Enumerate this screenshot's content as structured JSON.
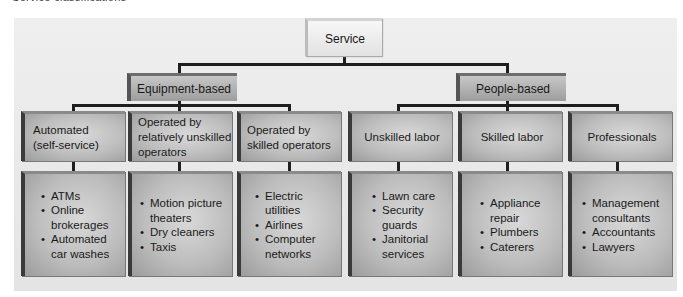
{
  "caption": "Service classifications",
  "root": {
    "label": "Service"
  },
  "categories": [
    {
      "label": "Equipment-based",
      "children": [
        {
          "label_lines": [
            "Automated",
            "(self-service)"
          ],
          "examples": [
            "ATMs",
            "Online brokerages",
            "Automated car washes"
          ]
        },
        {
          "label_lines": [
            "Operated by",
            "relatively unskilled",
            "operators"
          ],
          "examples": [
            "Motion picture theaters",
            "Dry cleaners",
            "Taxis"
          ]
        },
        {
          "label_lines": [
            "Operated by",
            "skilled operators"
          ],
          "examples": [
            "Electric utilities",
            "Airlines",
            "Computer networks"
          ]
        }
      ]
    },
    {
      "label": "People-based",
      "children": [
        {
          "label_lines": [
            "Unskilled labor"
          ],
          "examples": [
            "Lawn care",
            "Security guards",
            "Janitorial services"
          ]
        },
        {
          "label_lines": [
            "Skilled labor"
          ],
          "examples": [
            "Appliance repair",
            "Plumbers",
            "Caterers"
          ]
        },
        {
          "label_lines": [
            "Professionals"
          ],
          "examples": [
            "Management consultants",
            "Accountants",
            "Lawyers"
          ]
        }
      ]
    }
  ],
  "colors": {
    "panel": "#ebebeb",
    "box": "#bdbdbd",
    "box_dark_edge": "#3a3a3a",
    "connector": "#1e1e1e",
    "root_box": "#eeeeee"
  }
}
